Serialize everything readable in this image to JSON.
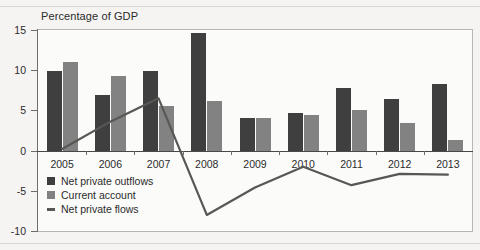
{
  "chart_data": {
    "type": "bar",
    "title": "Percentage of GDP",
    "xlabel": "",
    "ylabel": "",
    "ylim": [
      -10,
      15
    ],
    "yticks": [
      15,
      10,
      5,
      0,
      -5,
      -10
    ],
    "ytick_labels": [
      "15",
      "10",
      "5",
      "0",
      "-5",
      "-10"
    ],
    "grid": false,
    "legend_position": "inside-lower-left",
    "categories": [
      "2005",
      "2006",
      "2007",
      "2008",
      "2009",
      "2010",
      "2011",
      "2012",
      "2013"
    ],
    "series": [
      {
        "name": "Net private outflows",
        "type": "bar",
        "color": "#3f3f3f",
        "values": [
          9.9,
          6.9,
          9.9,
          14.6,
          4.0,
          4.7,
          7.8,
          6.4,
          8.3
        ]
      },
      {
        "name": "Current account",
        "type": "bar",
        "color": "#828282",
        "values": [
          11.0,
          9.3,
          5.5,
          6.2,
          4.1,
          4.4,
          5.0,
          3.4,
          1.3
        ]
      },
      {
        "name": "Net private flows",
        "type": "line",
        "color": "#595755",
        "values": [
          0.2,
          3.6,
          6.5,
          -8.0,
          -4.6,
          -2.0,
          -4.3,
          -2.9,
          -3.0
        ]
      }
    ]
  },
  "legend": {
    "items": [
      {
        "label": "Net private outflows",
        "swatch": "square",
        "color": "#3f3f3f"
      },
      {
        "label": "Current account",
        "swatch": "square",
        "color": "#828282"
      },
      {
        "label": "Net private flows",
        "swatch": "line",
        "color": "#595755"
      }
    ]
  }
}
